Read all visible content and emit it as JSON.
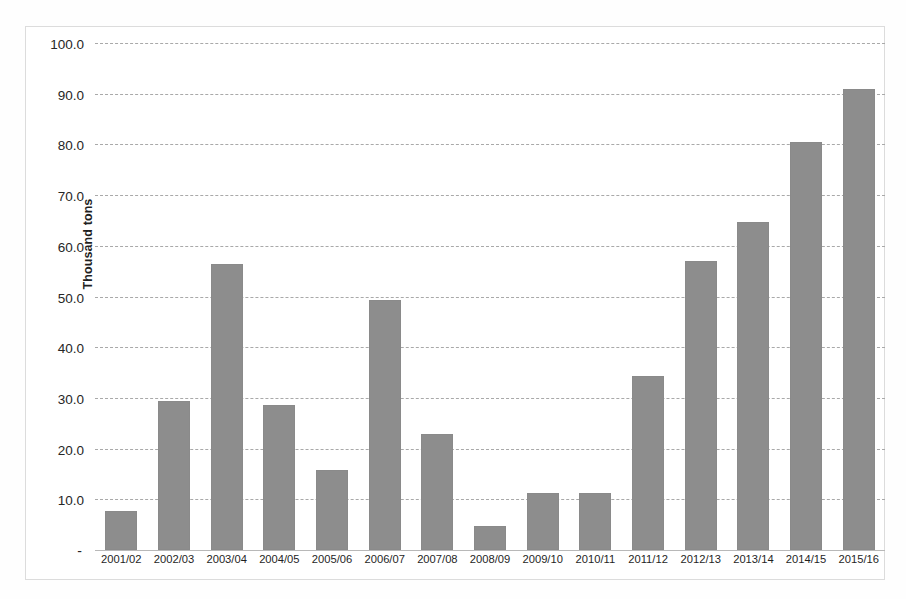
{
  "chart_data": {
    "type": "bar",
    "title": "",
    "xlabel": "",
    "ylabel": "Thousand tons",
    "ylim": [
      0,
      100
    ],
    "grid": true,
    "legend": "none",
    "bar_color": "#8d8d8d",
    "gridline_color": "#a9a9a9",
    "categories": [
      "2001/02",
      "2002/03",
      "2003/04",
      "2004/05",
      "2005/06",
      "2006/07",
      "2007/08",
      "2008/09",
      "2009/10",
      "2010/11",
      "2011/12",
      "2012/13",
      "2013/14",
      "2014/15",
      "2015/16"
    ],
    "values": [
      7.7,
      29.4,
      56.5,
      28.6,
      15.8,
      49.4,
      22.9,
      4.7,
      11.2,
      11.2,
      34.4,
      57.1,
      64.7,
      80.4,
      91.0
    ],
    "ytick_labels": [
      "100.0",
      "90.0",
      "80.0",
      "70.0",
      "60.0",
      "50.0",
      "40.0",
      "30.0",
      "20.0",
      "10.0",
      "-"
    ],
    "ytick_values": [
      100,
      90,
      80,
      70,
      60,
      50,
      40,
      30,
      20,
      10,
      0
    ]
  },
  "caption_fragment": ""
}
